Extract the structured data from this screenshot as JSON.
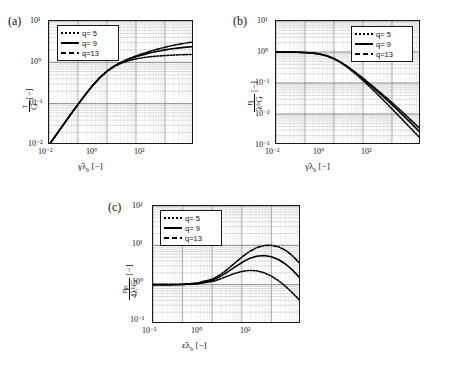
{
  "figure": {
    "panels": [
      {
        "tag": "(a)",
        "legend_pos": "top-left",
        "xlabel_parts": {
          "rate": "γ̇",
          "lambda": "λ",
          "sub": "b",
          "unit": "[−]"
        },
        "ylabel_num": "τ",
        "ylabel_den": "G",
        "ylabel_unit": "[−]",
        "xticks": [
          "10⁻²",
          "10⁰",
          "10²"
        ],
        "yticks": [
          "10¹",
          "10⁰",
          "10⁻¹",
          "10⁻²"
        ]
      },
      {
        "tag": "(b)",
        "legend_pos": "top-right",
        "xlabel_parts": {
          "rate": "γ̇",
          "lambda": "λ",
          "sub": "b",
          "unit": "[−]"
        },
        "ylabel_num": "η",
        "ylabel_den": "λᵇG",
        "ylabel_unit": "[−]",
        "xticks": [
          "10⁻²",
          "10⁰",
          "10²"
        ],
        "yticks": [
          "10¹",
          "10⁰",
          "10⁻¹",
          "10⁻²",
          "10⁻³"
        ]
      },
      {
        "tag": "(c)",
        "legend_pos": "top-left",
        "xlabel_parts": {
          "rate": "ε̇",
          "lambda": "λ",
          "sub": "b",
          "unit": "[−]"
        },
        "ylabel_num": "ηₚ",
        "ylabel_den": "4λᵇG",
        "ylabel_unit": "[−]",
        "xticks": [
          "10⁻²",
          "10⁰",
          "10²"
        ],
        "yticks": [
          "10²",
          "10¹",
          "10⁰",
          "10⁻¹"
        ]
      }
    ],
    "legend_entries": [
      {
        "label": "q= 5",
        "style": "dotted"
      },
      {
        "label": "q= 9",
        "style": "solid"
      },
      {
        "label": "q=13",
        "style": "dashdot"
      }
    ],
    "colors": {
      "curve": "#000000",
      "axis": "#1a1a1a",
      "grid_major": "#6a6a6a",
      "grid_minor": "#b4b4b4"
    }
  },
  "chart_data": [
    {
      "type": "line",
      "panel": "(a)",
      "title": "",
      "xlabel": "γ̇λ_b [−]",
      "ylabel": "τ/G [−]",
      "xscale": "log",
      "yscale": "log",
      "xlim": [
        0.01,
        1000
      ],
      "ylim": [
        0.01,
        10
      ],
      "grid": true,
      "legend_position": "upper left",
      "x": [
        0.01,
        0.0178,
        0.0316,
        0.0562,
        0.1,
        0.178,
        0.316,
        0.562,
        1.0,
        1.78,
        3.16,
        5.62,
        10.0,
        17.8,
        31.6,
        56.2,
        100.0,
        178.0,
        316.0,
        562.0,
        1000.0
      ],
      "series": [
        {
          "name": "q= 5",
          "style": "dotted",
          "values": [
            0.01,
            0.0177,
            0.0313,
            0.055,
            0.0955,
            0.163,
            0.27,
            0.42,
            0.6,
            0.79,
            0.96,
            1.1,
            1.21,
            1.3,
            1.37,
            1.42,
            1.46,
            1.49,
            1.52,
            1.54,
            1.56
          ]
        },
        {
          "name": "q= 9",
          "style": "solid",
          "values": [
            0.01,
            0.0177,
            0.0313,
            0.0552,
            0.096,
            0.165,
            0.273,
            0.425,
            0.61,
            0.81,
            1.0,
            1.18,
            1.36,
            1.53,
            1.7,
            1.86,
            2.0,
            2.13,
            2.24,
            2.33,
            2.4
          ]
        },
        {
          "name": "q=13",
          "style": "dashdot",
          "values": [
            0.01,
            0.0177,
            0.0313,
            0.0553,
            0.0962,
            0.166,
            0.275,
            0.428,
            0.615,
            0.82,
            1.02,
            1.22,
            1.43,
            1.64,
            1.86,
            2.09,
            2.32,
            2.55,
            2.76,
            2.95,
            3.1
          ]
        }
      ]
    },
    {
      "type": "line",
      "panel": "(b)",
      "title": "",
      "xlabel": "γ̇λ_b [−]",
      "ylabel": "η/(λ_b G) [−]",
      "xscale": "log",
      "yscale": "log",
      "xlim": [
        0.01,
        1000
      ],
      "ylim": [
        0.001,
        10
      ],
      "grid": true,
      "legend_position": "upper right",
      "x": [
        0.01,
        0.0178,
        0.0316,
        0.0562,
        0.1,
        0.178,
        0.316,
        0.562,
        1.0,
        1.78,
        3.16,
        5.62,
        10.0,
        17.8,
        31.6,
        56.2,
        100.0,
        178.0,
        316.0,
        562.0,
        1000.0
      ],
      "series": [
        {
          "name": "q= 5",
          "style": "dotted",
          "values": [
            1.0,
            0.995,
            0.99,
            0.978,
            0.955,
            0.916,
            0.854,
            0.747,
            0.6,
            0.444,
            0.304,
            0.196,
            0.121,
            0.073,
            0.0434,
            0.0253,
            0.0146,
            0.00837,
            0.00481,
            0.00274,
            0.00156
          ]
        },
        {
          "name": "q= 9",
          "style": "solid",
          "values": [
            1.0,
            0.995,
            0.991,
            0.982,
            0.96,
            0.927,
            0.864,
            0.756,
            0.61,
            0.455,
            0.316,
            0.21,
            0.136,
            0.086,
            0.0538,
            0.0331,
            0.02,
            0.012,
            0.00709,
            0.00415,
            0.0024
          ]
        },
        {
          "name": "q=13",
          "style": "dashdot",
          "values": [
            1.0,
            0.995,
            0.991,
            0.983,
            0.962,
            0.933,
            0.87,
            0.761,
            0.615,
            0.461,
            0.323,
            0.217,
            0.143,
            0.0921,
            0.0588,
            0.0372,
            0.0232,
            0.0143,
            0.00873,
            0.00525,
            0.0031
          ]
        }
      ]
    },
    {
      "type": "line",
      "panel": "(c)",
      "title": "",
      "xlabel": "ε̇λ_b [−]",
      "ylabel": "η_p/(4λ_b G) [−]",
      "xscale": "log",
      "yscale": "log",
      "xlim": [
        0.01,
        1000
      ],
      "ylim": [
        0.1,
        100
      ],
      "grid": true,
      "legend_position": "upper left",
      "x": [
        0.01,
        0.0316,
        0.1,
        0.316,
        1.0,
        1.78,
        3.16,
        5.62,
        10.0,
        17.8,
        31.6,
        56.2,
        100.0,
        178.0,
        316.0,
        562.0,
        1000.0
      ],
      "series": [
        {
          "name": "q= 5",
          "style": "dotted",
          "values": [
            1.0,
            1.0,
            1.01,
            1.05,
            1.2,
            1.38,
            1.63,
            1.92,
            2.17,
            2.3,
            2.26,
            2.02,
            1.65,
            1.25,
            0.88,
            0.58,
            0.37
          ]
        },
        {
          "name": "q= 9",
          "style": "solid",
          "values": [
            1.0,
            1.0,
            1.02,
            1.08,
            1.3,
            1.58,
            2.05,
            2.75,
            3.65,
            4.6,
            5.3,
            5.5,
            5.15,
            4.3,
            3.25,
            2.2,
            1.38
          ]
        },
        {
          "name": "q=13",
          "style": "dashdot",
          "values": [
            1.0,
            1.0,
            1.02,
            1.1,
            1.38,
            1.75,
            2.4,
            3.45,
            5.0,
            6.9,
            8.7,
            9.85,
            10.0,
            9.1,
            7.3,
            5.1,
            3.2
          ]
        }
      ]
    }
  ]
}
